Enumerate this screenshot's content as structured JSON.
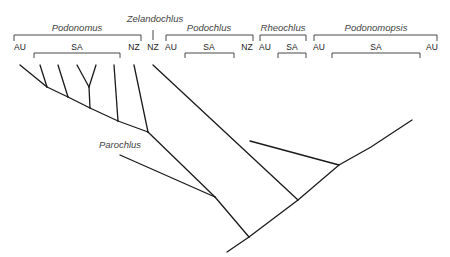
{
  "diagram": {
    "type": "phylogenetic-cladogram",
    "genera": [
      {
        "name": "Podonomus",
        "regions": [
          "AU",
          "SA",
          "NZ"
        ]
      },
      {
        "name": "Zelandochlus",
        "regions": [
          "NZ"
        ]
      },
      {
        "name": "Podochlus",
        "regions": [
          "AU",
          "SA",
          "NZ"
        ]
      },
      {
        "name": "Rheochlus",
        "regions": [
          "AU",
          "SA"
        ]
      },
      {
        "name": "Podonomopsis",
        "regions": [
          "AU",
          "SA",
          "AU"
        ]
      }
    ],
    "outgroup": "Parochlus",
    "genus_labels": {
      "podonomus": "Podonomus",
      "zelandochlus": "Zelandochlus",
      "podochlus": "Podochlus",
      "rheochlus": "Rheochlus",
      "podonomopsis": "Podonomopsis",
      "parochlus": "Parochlus"
    },
    "region_labels": {
      "podonomus_au": "AU",
      "podonomus_sa": "SA",
      "podonomus_nz": "NZ",
      "zelandochlus_nz": "NZ",
      "podochlus_au": "AU",
      "podochlus_sa": "SA",
      "podochlus_nz": "NZ",
      "rheochlus_au": "AU",
      "rheochlus_sa": "SA",
      "podonomopsis_au1": "AU",
      "podonomopsis_sa": "SA",
      "podonomopsis_au2": "AU"
    },
    "node_numbers": [
      "1",
      "2",
      "3",
      "4",
      "5",
      "6",
      "7",
      "8",
      "9"
    ]
  }
}
